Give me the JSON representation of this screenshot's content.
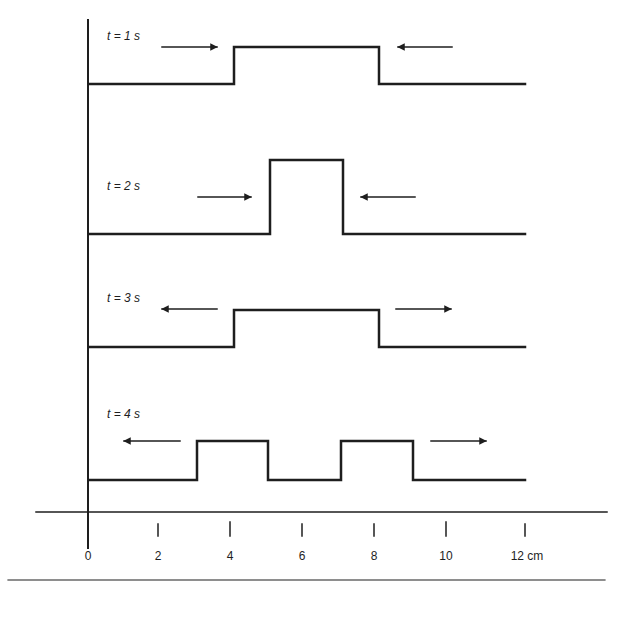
{
  "colors": {
    "ink": "#1e1e1e",
    "background": "#ffffff"
  },
  "axis": {
    "unit": "cm",
    "ticks": [
      {
        "value": 0,
        "label": "0"
      },
      {
        "value": 2,
        "label": "2"
      },
      {
        "value": 4,
        "label": "4"
      },
      {
        "value": 6,
        "label": "6"
      },
      {
        "value": 8,
        "label": "8"
      },
      {
        "value": 10,
        "label": "10"
      },
      {
        "value": 12,
        "label": "12 cm"
      }
    ]
  },
  "panels": [
    {
      "label": "t = 1 s",
      "pulses": [
        {
          "start_cm": 4,
          "end_cm": 8,
          "height": "tall-wide"
        }
      ],
      "arrows": [
        {
          "direction": "right",
          "position": "left of pulse"
        },
        {
          "direction": "left",
          "position": "right of pulse"
        }
      ]
    },
    {
      "label": "t = 2 s",
      "pulses": [
        {
          "start_cm": 5,
          "end_cm": 7,
          "height": "double"
        }
      ],
      "arrows": [
        {
          "direction": "right",
          "position": "left of pulse"
        },
        {
          "direction": "left",
          "position": "right of pulse"
        }
      ]
    },
    {
      "label": "t = 3 s",
      "pulses": [
        {
          "start_cm": 4,
          "end_cm": 8,
          "height": "single"
        }
      ],
      "arrows": [
        {
          "direction": "left",
          "position": "left of pulse"
        },
        {
          "direction": "right",
          "position": "right of pulse"
        }
      ]
    },
    {
      "label": "t = 4 s",
      "pulses": [
        {
          "start_cm": 3,
          "end_cm": 5,
          "height": "single"
        },
        {
          "start_cm": 7,
          "end_cm": 9,
          "height": "single"
        }
      ],
      "arrows": [
        {
          "direction": "left",
          "position": "left of pulses"
        },
        {
          "direction": "right",
          "position": "right of pulses"
        }
      ]
    }
  ]
}
